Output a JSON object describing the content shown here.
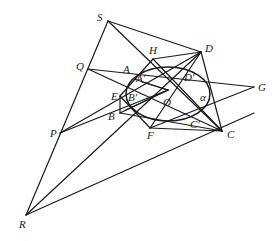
{
  "diagram": {
    "type": "projective-geometry-figure",
    "stroke_color": "#1a1a1a",
    "background": "#ffffff",
    "points": {
      "S": [
        108,
        21
      ],
      "D": [
        201,
        52
      ],
      "H": [
        153,
        59
      ],
      "Q": [
        88,
        69
      ],
      "A": [
        134,
        79
      ],
      "A'": [
        142,
        82
      ],
      "E": [
        120,
        96
      ],
      "B'": [
        145,
        97
      ],
      "O": [
        168,
        90
      ],
      "D'": [
        184,
        75
      ],
      "G": [
        254,
        87
      ],
      "B": [
        120,
        113
      ],
      "F": [
        150,
        128
      ],
      "C'": [
        198,
        118
      ],
      "C": [
        222,
        131
      ],
      "P": [
        60,
        133
      ],
      "R": [
        26,
        215
      ]
    },
    "labels": [
      {
        "text": "S",
        "x": 97,
        "y": 21
      },
      {
        "text": "D",
        "x": 205,
        "y": 52
      },
      {
        "text": "H",
        "x": 149,
        "y": 54
      },
      {
        "text": "Q",
        "x": 76,
        "y": 70
      },
      {
        "text": "A",
        "x": 123,
        "y": 73
      },
      {
        "text": "A'",
        "x": 136,
        "y": 82
      },
      {
        "text": "D'",
        "x": 184,
        "y": 81
      },
      {
        "text": "G",
        "x": 258,
        "y": 91
      },
      {
        "text": "E",
        "x": 111,
        "y": 100
      },
      {
        "text": "B'",
        "x": 128,
        "y": 101
      },
      {
        "text": "O",
        "x": 163,
        "y": 106
      },
      {
        "text": "α",
        "x": 200,
        "y": 101
      },
      {
        "text": "B",
        "x": 108,
        "y": 120
      },
      {
        "text": "C'",
        "x": 190,
        "y": 128
      },
      {
        "text": "F",
        "x": 147,
        "y": 139
      },
      {
        "text": "C",
        "x": 227,
        "y": 138
      },
      {
        "text": "P",
        "x": 50,
        "y": 137
      },
      {
        "text": "R",
        "x": 19,
        "y": 228
      }
    ],
    "segments": [
      [
        "S",
        "D"
      ],
      [
        "S",
        "R"
      ],
      [
        "S",
        "C"
      ],
      [
        "D",
        "C"
      ],
      [
        "D",
        "R"
      ],
      [
        "Q",
        "G"
      ],
      [
        "Q",
        "C"
      ],
      [
        "P",
        "D"
      ],
      [
        "P",
        "C"
      ],
      [
        "R",
        "C"
      ],
      [
        "P",
        "B"
      ],
      [
        "H",
        "F"
      ],
      [
        "H",
        "D"
      ],
      [
        "E",
        "F"
      ],
      [
        "F",
        "C"
      ],
      [
        "E",
        "B"
      ],
      [
        "A",
        "O"
      ],
      [
        "B",
        "O"
      ],
      [
        "B'",
        "O"
      ],
      [
        "A'",
        "O"
      ],
      [
        "E",
        "O"
      ],
      [
        "D",
        "F"
      ]
    ],
    "ellipse": {
      "name": "α",
      "cx": 168,
      "cy": 94,
      "rx": 42,
      "ry": 27,
      "rotate": 0
    }
  }
}
